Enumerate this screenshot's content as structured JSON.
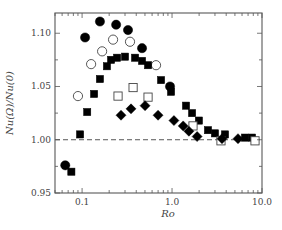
{
  "chart_data": {
    "type": "scatter",
    "title": "",
    "xlabel": "Ro",
    "ylabel": "Nu(Ω)/Nu(0)",
    "xscale": "log",
    "xlim": [
      0.05,
      10.0
    ],
    "ylim": [
      0.95,
      1.119
    ],
    "xticks": [
      {
        "value": 0.1,
        "label": "0.1"
      },
      {
        "value": 1.0,
        "label": "1.0"
      },
      {
        "value": 10.0,
        "label": "10.0"
      }
    ],
    "yticks": [
      {
        "value": 0.95,
        "label": "0.95"
      },
      {
        "value": 1.0,
        "label": "1.00"
      },
      {
        "value": 1.05,
        "label": "1.05"
      },
      {
        "value": 1.1,
        "label": "1.10"
      }
    ],
    "reference_line": {
      "y": 1.0,
      "style": "dashed"
    },
    "grid": false,
    "legend": null,
    "series": [
      {
        "name": "filled-circles",
        "marker": "circle",
        "filled": true,
        "x": [
          0.065,
          0.108,
          0.158,
          0.239,
          0.324,
          0.464,
          0.95
        ],
        "y": [
          0.976,
          1.096,
          1.111,
          1.108,
          1.103,
          1.086,
          1.05
        ]
      },
      {
        "name": "open-circles",
        "marker": "circle",
        "filled": false,
        "x": [
          0.09,
          0.126,
          0.167,
          0.221,
          0.341,
          0.664
        ],
        "y": [
          1.041,
          1.071,
          1.083,
          1.094,
          1.092,
          1.07
        ]
      },
      {
        "name": "filled-squares",
        "marker": "square",
        "filled": true,
        "x": [
          0.076,
          0.095,
          0.114,
          0.136,
          0.158,
          0.189,
          0.21,
          0.245,
          0.3,
          0.388,
          0.464,
          0.541,
          0.755,
          0.975,
          1.43,
          1.67,
          1.99,
          2.51,
          3.0,
          3.88,
          6.47,
          7.74
        ],
        "y": [
          0.97,
          1.005,
          1.026,
          1.043,
          1.057,
          1.069,
          1.075,
          1.077,
          1.078,
          1.077,
          1.074,
          1.07,
          1.056,
          1.045,
          1.032,
          1.025,
          1.018,
          1.009,
          1.006,
          1.005,
          1.002,
          1.002
        ]
      },
      {
        "name": "open-squares",
        "marker": "square",
        "filled": false,
        "x": [
          0.251,
          0.369,
          0.541,
          1.71,
          3.5,
          8.36
        ],
        "y": [
          1.041,
          1.049,
          1.04,
          1.013,
          0.999,
          0.999
        ]
      },
      {
        "name": "filled-diamonds",
        "marker": "diamond",
        "filled": true,
        "x": [
          0.271,
          0.35,
          0.501,
          0.699,
          1.05,
          1.33,
          1.54,
          1.9,
          3.59,
          5.41
        ],
        "y": [
          1.023,
          1.029,
          1.032,
          1.023,
          1.018,
          1.013,
          1.008,
          1.003,
          1.001,
          1.001
        ]
      }
    ]
  },
  "colors": {
    "axis": "#555555",
    "marker": "#000000",
    "text": "#444444"
  }
}
